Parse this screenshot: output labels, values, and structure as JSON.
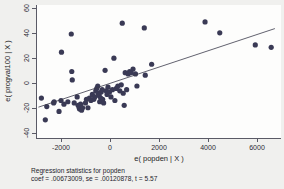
{
  "chart_data": {
    "type": "scatter",
    "title": "",
    "xlabel": "e( popden | X )",
    "ylabel": "e( progval100 | X )",
    "xlim": [
      -3000,
      7000
    ],
    "ylim": [
      -45,
      65
    ],
    "xticks": [
      -2000,
      0,
      2000,
      4000,
      6000
    ],
    "xtick_labels": [
      "-2000",
      "0",
      "2000",
      "4000",
      "6000"
    ],
    "yticks": [
      -40,
      -20,
      0,
      20,
      40,
      60
    ],
    "ytick_labels": [
      "-40",
      "-20",
      "0",
      "20",
      "40",
      "60"
    ],
    "grid": false,
    "legend": "none",
    "marker_color": "#3a3a55",
    "fit_line_color": "#3a3a4a",
    "points": [
      [
        -2780,
        -12
      ],
      [
        -2620,
        -30
      ],
      [
        -2560,
        -19
      ],
      [
        -2280,
        -16
      ],
      [
        -2260,
        -15
      ],
      [
        -2060,
        -23
      ],
      [
        -1980,
        -14
      ],
      [
        -1960,
        26
      ],
      [
        -1860,
        -17
      ],
      [
        -1700,
        -15
      ],
      [
        -1560,
        41
      ],
      [
        -1540,
        10
      ],
      [
        -1520,
        3
      ],
      [
        -1440,
        -16
      ],
      [
        -1320,
        -11
      ],
      [
        -1280,
        -18
      ],
      [
        -1240,
        -20
      ],
      [
        -1220,
        -21
      ],
      [
        -1200,
        -19
      ],
      [
        -1180,
        -17
      ],
      [
        -1140,
        -22
      ],
      [
        -1100,
        -20
      ],
      [
        -980,
        -16
      ],
      [
        -940,
        -13
      ],
      [
        -880,
        -20
      ],
      [
        -820,
        -12
      ],
      [
        -760,
        -14
      ],
      [
        -700,
        -9
      ],
      [
        -640,
        -13
      ],
      [
        -600,
        -11
      ],
      [
        -560,
        -6
      ],
      [
        -520,
        -4
      ],
      [
        -480,
        -2
      ],
      [
        -460,
        -8
      ],
      [
        -420,
        -10
      ],
      [
        -400,
        -15
      ],
      [
        -360,
        -12
      ],
      [
        -340,
        -7
      ],
      [
        -300,
        -5
      ],
      [
        -280,
        -13
      ],
      [
        -240,
        -16
      ],
      [
        -180,
        11
      ],
      [
        -140,
        -6
      ],
      [
        -100,
        -9
      ],
      [
        -60,
        -3
      ],
      [
        0,
        -7
      ],
      [
        60,
        -11
      ],
      [
        120,
        -5
      ],
      [
        180,
        21
      ],
      [
        220,
        -14
      ],
      [
        280,
        -4
      ],
      [
        340,
        -2
      ],
      [
        420,
        -6
      ],
      [
        480,
        -1
      ],
      [
        520,
        50
      ],
      [
        560,
        -8
      ],
      [
        600,
        -18
      ],
      [
        640,
        9
      ],
      [
        700,
        -5
      ],
      [
        760,
        8
      ],
      [
        820,
        10
      ],
      [
        880,
        9
      ],
      [
        960,
        12
      ],
      [
        1060,
        8
      ],
      [
        1120,
        -2
      ],
      [
        1420,
        46
      ],
      [
        1460,
        7
      ],
      [
        1720,
        16
      ],
      [
        3900,
        51
      ],
      [
        4500,
        42
      ],
      [
        5950,
        32
      ],
      [
        6600,
        30
      ]
    ],
    "fit_line": {
      "x0": -2900,
      "y0": -19.5,
      "x1": 6750,
      "y1": 45.5
    },
    "caption_line1": "Regression statistics for popden",
    "caption_line2": "coef = .00673009, se = .00120878, t = 5.57"
  }
}
